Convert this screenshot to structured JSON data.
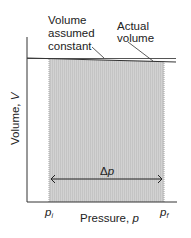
{
  "diagram": {
    "annotations": {
      "assumed": [
        "Volume",
        "assumed",
        "constant"
      ],
      "actual": [
        "Actual",
        "volume"
      ]
    },
    "y_axis_label": "Volume, ",
    "y_axis_var": "V",
    "x_axis_label": "Pressure, ",
    "x_axis_var": "p",
    "delta_label": "Δ",
    "delta_var": "p",
    "p_initial": "p",
    "p_initial_sub": "i",
    "p_final": "p",
    "p_final_sub": "f",
    "colors": {
      "shade": "#cfcfcf",
      "line": "#333333",
      "edge": "#9a9a9a"
    }
  }
}
